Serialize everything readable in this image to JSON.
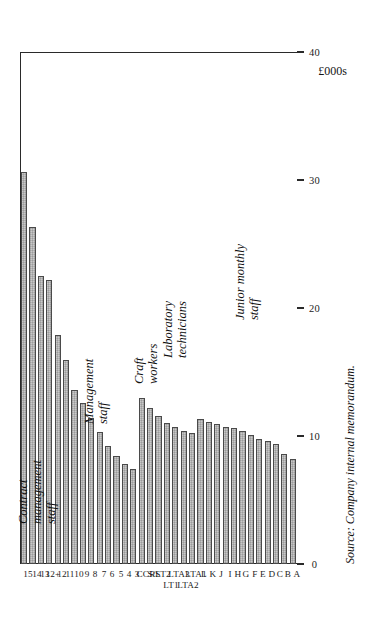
{
  "figure": {
    "axis_title": "£000s",
    "source_note": "Source: Company internal memorandum."
  },
  "chart_data": {
    "type": "bar",
    "orientation": "vertical-columns-rotated",
    "title": "",
    "xlabel": "",
    "ylabel": "£000s",
    "ylim": [
      0,
      40
    ],
    "yticks": [
      0,
      10,
      20,
      30,
      40
    ],
    "ytick_labels": [
      "0",
      "10",
      "20",
      "30",
      "40"
    ],
    "grid": false,
    "legend": "none",
    "categories": [
      "A",
      "B",
      "C",
      "D",
      "E",
      "F",
      "G",
      "H",
      "I",
      "J",
      "K",
      "L",
      "LTA1",
      "LTA2",
      "LTA3",
      "LT1",
      "LT2",
      "S/S",
      "CCR",
      "3",
      "4",
      "5",
      "6",
      "7",
      "8",
      "9",
      "10",
      "11",
      "12",
      "12+",
      "13",
      "14",
      "15"
    ],
    "values": [
      8.2,
      8.6,
      9.4,
      9.6,
      9.8,
      10.1,
      10.4,
      10.6,
      10.7,
      10.9,
      11.1,
      11.3,
      10.2,
      10.4,
      10.7,
      11.0,
      11.6,
      12.2,
      13.0,
      7.4,
      7.8,
      8.4,
      9.2,
      10.3,
      11.4,
      12.6,
      13.6,
      15.9,
      17.9,
      22.2,
      22.5,
      26.3,
      30.6
    ],
    "groups": [
      {
        "label": "Junior monthly\nstaff",
        "categories": [
          "A",
          "B",
          "C",
          "D",
          "E",
          "F",
          "G",
          "H",
          "I",
          "J",
          "K",
          "L"
        ]
      },
      {
        "label": "Laboratory\ntechnicians",
        "categories": [
          "LTA1",
          "LTA2",
          "LTA3",
          "LT1",
          "LT2"
        ]
      },
      {
        "label": "Craft\nworkers",
        "categories": [
          "S/S",
          "CCR"
        ]
      },
      {
        "label": "Management\nstaff",
        "categories": [
          "3",
          "4",
          "5",
          "6",
          "7",
          "8",
          "9",
          "10",
          "11",
          "12"
        ]
      },
      {
        "label": "Contract\nmanagement\nstaff",
        "categories": [
          "12+",
          "13",
          "14",
          "15"
        ]
      }
    ],
    "tick_label_rows": {
      "note": "Laboratory technician ticks are printed on two staggered rows",
      "top_row": [
        "LTA1",
        "LTA3",
        "LT2"
      ],
      "bottom_row": [
        "LTA2",
        "LT1"
      ]
    }
  }
}
